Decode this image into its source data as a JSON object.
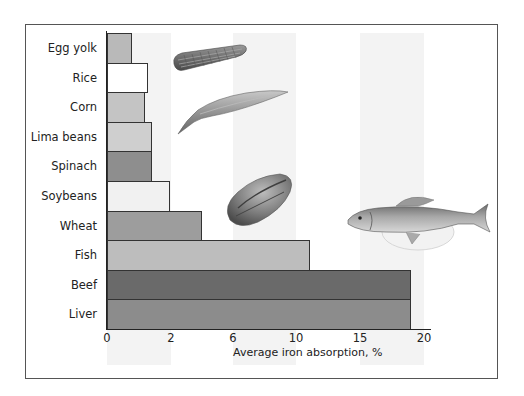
{
  "chart_data": {
    "type": "bar",
    "orientation": "horizontal",
    "title": "",
    "xlabel": "Average iron absorption, %",
    "ylabel": "",
    "categories": [
      "Egg yolk",
      "Rice",
      "Corn",
      "Lima beans",
      "Spinach",
      "Soybeans",
      "Wheat",
      "Fish",
      "Beef",
      "Liver"
    ],
    "values": [
      0.8,
      1.3,
      1.2,
      1.4,
      1.4,
      2.0,
      4.0,
      11.0,
      19.0,
      19.0
    ],
    "bar_colors": [
      "#b9b9b9",
      "#ffffff",
      "#c4c4c4",
      "#cfcfcf",
      "#8e8e8e",
      "#f1f1f1",
      "#9d9d9d",
      "#bdbdbd",
      "#6a6a6a",
      "#8c8c8c"
    ],
    "x_ticks": [
      "0",
      "2",
      "6",
      "10",
      "15",
      "20"
    ],
    "x_scale_note": "non-linear axis; tick labels equally spaced",
    "xlim": [
      0,
      20
    ],
    "grid": false,
    "legend": null,
    "annotations": [
      "corn illustration",
      "bean pod illustration",
      "soybean illustration",
      "fish illustration"
    ]
  },
  "axis": {
    "x_title": "Average iron absorption, %",
    "ticks": [
      {
        "label": "0",
        "x": 107
      },
      {
        "label": "2",
        "x": 171
      },
      {
        "label": "6",
        "x": 233
      },
      {
        "label": "10",
        "x": 296
      },
      {
        "label": "15",
        "x": 360
      },
      {
        "label": "20",
        "x": 424
      }
    ]
  },
  "bars": [
    {
      "label": "Egg yolk",
      "value": 0.8,
      "end_x": 132,
      "color": "#b9b9b9"
    },
    {
      "label": "Rice",
      "value": 1.3,
      "end_x": 148,
      "color": "#ffffff"
    },
    {
      "label": "Corn",
      "value": 1.2,
      "end_x": 145,
      "color": "#c4c4c4"
    },
    {
      "label": "Lima beans",
      "value": 1.4,
      "end_x": 152,
      "color": "#cfcfcf"
    },
    {
      "label": "Spinach",
      "value": 1.4,
      "end_x": 152,
      "color": "#8e8e8e"
    },
    {
      "label": "Soybeans",
      "value": 2.0,
      "end_x": 170,
      "color": "#f1f1f1"
    },
    {
      "label": "Wheat",
      "value": 4.0,
      "end_x": 202,
      "color": "#9d9d9d"
    },
    {
      "label": "Fish",
      "value": 11.0,
      "end_x": 310,
      "color": "#bdbdbd"
    },
    {
      "label": "Beef",
      "value": 19.0,
      "end_x": 411,
      "color": "#6a6a6a"
    },
    {
      "label": "Liver",
      "value": 19.0,
      "end_x": 411,
      "color": "#8c8c8c"
    }
  ]
}
